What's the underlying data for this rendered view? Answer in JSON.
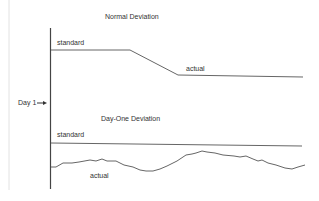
{
  "diagram": {
    "top_panel": {
      "title": "Normal Deviation",
      "standard_label": "standard",
      "actual_label": "actual"
    },
    "marker": {
      "label": "Day 1",
      "arrow": "→"
    },
    "bottom_panel": {
      "title": "Day-One Deviation",
      "standard_label": "standard",
      "actual_label": "actual"
    },
    "colors": {
      "line": "#555555",
      "text": "#333333",
      "margin_line": "#dddddd"
    }
  }
}
